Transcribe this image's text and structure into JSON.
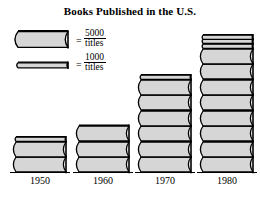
{
  "chart_data": {
    "type": "bar",
    "title": "Books Published in the U.S.",
    "xlabel": "",
    "ylabel": "",
    "categories": [
      "1950",
      "1960",
      "1970",
      "1980"
    ],
    "values": [
      11000,
      15000,
      31000,
      43000
    ],
    "unit": "titles",
    "pictograph": true,
    "symbols": [
      {
        "name": "thick-book",
        "value": 5000,
        "label_number": "5000",
        "label_unit": "titles"
      },
      {
        "name": "thin-book",
        "value": 1000,
        "label_number": "1000",
        "label_unit": "titles"
      }
    ],
    "symbol_counts": [
      {
        "category": "1950",
        "thick": 2,
        "thin": 1
      },
      {
        "category": "1960",
        "thick": 3,
        "thin": 0
      },
      {
        "category": "1970",
        "thick": 6,
        "thin": 1
      },
      {
        "category": "1980",
        "thick": 8,
        "thin": 3
      }
    ],
    "grid": false,
    "legend_position": "top-left"
  },
  "title": "Books Published in the U.S.",
  "legend": {
    "equals_sign": "=",
    "entries": [
      {
        "symbol": "thick-book",
        "number": "5000",
        "unit": "titles"
      },
      {
        "symbol": "thin-book",
        "number": "1000",
        "unit": "titles"
      }
    ]
  },
  "axis": {
    "year_labels": [
      "1950",
      "1960",
      "1970",
      "1980"
    ]
  },
  "colors": {
    "book_fill": "#d6d6d6",
    "book_outline": "#000000",
    "background": "#ffffff",
    "text": "#000000"
  }
}
